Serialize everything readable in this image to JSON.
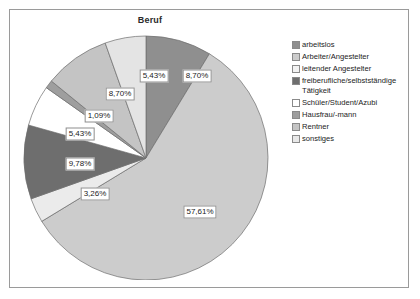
{
  "chart_data": {
    "type": "pie",
    "title": "Beruf",
    "categories": [
      "arbeitslos",
      "Arbeiter/Angestelter",
      "leitender Angestelter",
      "freiberufliche/selbstständige Tätigkeit",
      "Schüler/Student/Azubi",
      "Hausfrau/-mann",
      "Rentner",
      "sonstiges"
    ],
    "values": [
      8.7,
      57.61,
      3.26,
      9.78,
      5.43,
      1.09,
      8.7,
      5.43
    ],
    "value_labels": [
      "8,70%",
      "57,61%",
      "3,26%",
      "9,78%",
      "5,43%",
      "1,09%",
      "8,70%",
      "5,43%"
    ],
    "colors": [
      "#8f8f8f",
      "#cccccc",
      "#ebebeb",
      "#6e6e6e",
      "#ffffff",
      "#9e9e9e",
      "#c4c4c4",
      "#e4e4e4"
    ],
    "legend_position": "right",
    "start_angle_deg": 0,
    "direction": "clockwise",
    "xlabel": "",
    "ylabel": ""
  },
  "legend": {
    "items": [
      {
        "label": "arbeitslos",
        "color": "#8f8f8f"
      },
      {
        "label": "Arbeiter/Angestelter",
        "color": "#cccccc"
      },
      {
        "label": "leitender Angestelter",
        "color": "#f2f2f2"
      },
      {
        "label": "freiberufliche/selbstständige Tätigkeit",
        "color": "#6e6e6e"
      },
      {
        "label": "Schüler/Student/Azubi",
        "color": "#ffffff"
      },
      {
        "label": "Hausfrau/-mann",
        "color": "#9e9e9e"
      },
      {
        "label": "Rentner",
        "color": "#c4c4c4"
      },
      {
        "label": "sonstiges",
        "color": "#e8e8e8"
      }
    ]
  },
  "slice_labels": [
    {
      "text": "8,70%",
      "x": 175,
      "y": 48
    },
    {
      "text": "57,61%",
      "x": 178,
      "y": 184
    },
    {
      "text": "3,26%",
      "x": 73,
      "y": 166
    },
    {
      "text": "9,78%",
      "x": 58,
      "y": 136
    },
    {
      "text": "5,43%",
      "x": 58,
      "y": 106
    },
    {
      "text": "1,09%",
      "x": 77,
      "y": 88
    },
    {
      "text": "8,70%",
      "x": 98,
      "y": 66
    },
    {
      "text": "5,43%",
      "x": 132,
      "y": 48
    }
  ]
}
